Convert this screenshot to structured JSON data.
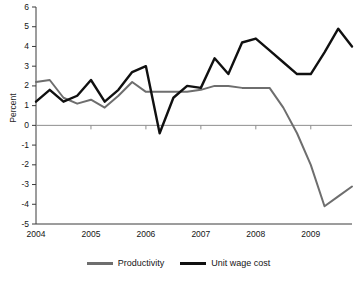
{
  "chart_data": {
    "type": "line",
    "title": "",
    "xlabel": "",
    "ylabel": "Percent",
    "ylim": [
      -5,
      6
    ],
    "xlim": [
      2004.0,
      2009.75
    ],
    "grid": false,
    "legend_position": "bottom",
    "y_ticks": [
      6,
      5,
      4,
      3,
      2,
      1,
      0,
      -1,
      -2,
      -3,
      -4,
      -5
    ],
    "y_tick_labels": [
      "6",
      "5",
      "4",
      "3",
      "2",
      "1",
      "0",
      "-1",
      "-2",
      "-3",
      "-4",
      "-5"
    ],
    "x_ticks": [
      2004,
      2005,
      2006,
      2007,
      2008,
      2009
    ],
    "x_tick_labels": [
      "2004",
      "2005",
      "2006",
      "2007",
      "2008",
      "2009"
    ],
    "x": [
      2004.0,
      2004.25,
      2004.5,
      2004.75,
      2005.0,
      2005.25,
      2005.5,
      2005.75,
      2006.0,
      2006.25,
      2006.5,
      2006.75,
      2007.0,
      2007.25,
      2007.5,
      2007.75,
      2008.0,
      2008.25,
      2008.5,
      2008.75,
      2009.0,
      2009.25,
      2009.5,
      2009.75
    ],
    "series": [
      {
        "name": "Productivity",
        "color": "#6e6e6e",
        "values": [
          2.2,
          2.3,
          1.4,
          1.1,
          1.3,
          0.9,
          1.5,
          2.2,
          1.7,
          1.7,
          1.7,
          1.7,
          1.8,
          2.0,
          2.0,
          1.9,
          1.9,
          1.9,
          0.9,
          -0.4,
          -2.0,
          -4.1,
          -3.6,
          -3.1
        ]
      },
      {
        "name": "Unit wage cost",
        "color": "#101010",
        "values": [
          1.2,
          1.8,
          1.2,
          1.5,
          2.3,
          1.2,
          1.8,
          2.7,
          3.0,
          -0.4,
          1.4,
          2.0,
          1.9,
          3.4,
          2.6,
          4.2,
          4.4,
          3.8,
          3.2,
          2.6,
          2.6,
          3.7,
          4.9,
          4.0
        ]
      }
    ]
  },
  "legend": {
    "items": [
      {
        "label": "Productivity",
        "color": "#6e6e6e"
      },
      {
        "label": "Unit wage cost",
        "color": "#101010"
      }
    ]
  },
  "axes": {
    "y_label": "Percent"
  }
}
